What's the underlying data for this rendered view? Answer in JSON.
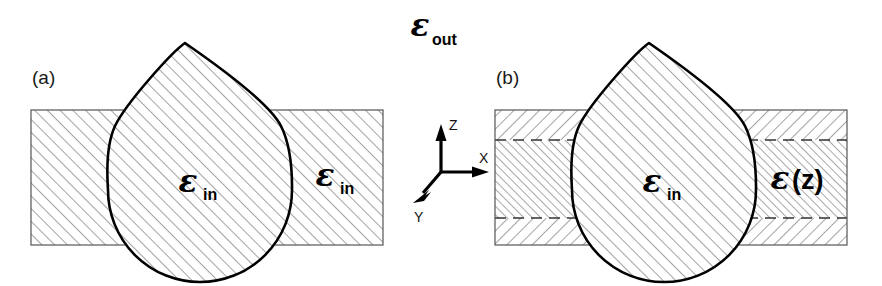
{
  "figure": {
    "type": "scientific-diagram",
    "background_color": "#ffffff",
    "outline_color": "#000000",
    "hatch_color": "#8c8c8c",
    "slab_border_color": "#555555"
  },
  "labels": {
    "epsilon_out": {
      "symbol": "ε",
      "subscript": "out"
    },
    "epsilon_in": {
      "symbol": "ε",
      "subscript": "in"
    },
    "epsilon_of_z": {
      "symbol": "ε",
      "argument": "(z)"
    }
  },
  "panels": [
    {
      "id": "a",
      "label": "(a)",
      "slab": {
        "x": 31,
        "y": 110,
        "width": 352,
        "height": 135,
        "layers": 1,
        "hatch_style": "uniform-45"
      },
      "droplet": {
        "apex_x": 185,
        "apex_y": 43,
        "center_x": 200,
        "center_y": 186,
        "radius": 92
      },
      "region_labels": [
        {
          "name": "droplet-interior",
          "text_symbol": "ε",
          "text_subscript": "in",
          "x": 196,
          "y": 188
        },
        {
          "name": "slab-right",
          "text_symbol": "ε",
          "text_subscript": "in",
          "x": 332,
          "y": 182
        }
      ]
    },
    {
      "id": "b",
      "label": "(b)",
      "slab": {
        "x": 495,
        "y": 110,
        "width": 352,
        "height": 135,
        "layers": 3,
        "hatch_style": "graded"
      },
      "dashed_lines_y": [
        140,
        218
      ],
      "droplet": {
        "apex_x": 649,
        "apex_y": 43,
        "center_x": 664,
        "center_y": 186,
        "radius": 92
      },
      "region_labels": [
        {
          "name": "droplet-interior",
          "text_symbol": "ε",
          "text_subscript": "in",
          "x": 660,
          "y": 188
        },
        {
          "name": "slab-right",
          "text_symbol": "ε",
          "text_argument": "(z)",
          "x": 790,
          "y": 182
        }
      ]
    }
  ],
  "axes": {
    "origin_x": 441,
    "origin_y": 172,
    "arrows": [
      {
        "name": "z-axis",
        "letter": "Z",
        "dx": 0,
        "dy": -44,
        "label_x": 449,
        "label_y": 128
      },
      {
        "name": "x-axis",
        "letter": "X",
        "dx": 46,
        "dy": 0,
        "label_x": 493,
        "label_y": 168
      },
      {
        "name": "y-axis",
        "letter": "Y",
        "dx": -27,
        "dy": 31,
        "label_x": 408,
        "label_y": 227
      }
    ]
  },
  "eps_out_position": {
    "x": 410,
    "y": 33
  }
}
